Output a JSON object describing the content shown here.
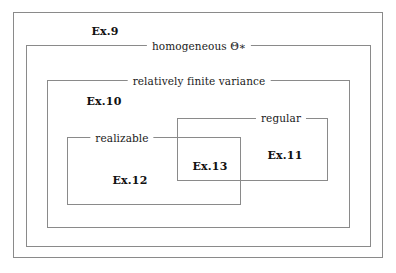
{
  "diagram": {
    "background_color": "#ffffff",
    "line_color": "#8a8a8a",
    "text_color": "#1a1a1a",
    "regions": [
      {
        "id": "outer",
        "edge_label": "",
        "example_label": "Ex.9",
        "x": 13,
        "y": 12,
        "width": 370,
        "height": 246
      },
      {
        "id": "homogeneous",
        "edge_label": "homogeneous Θ∗",
        "example_label": "",
        "x": 26,
        "y": 45,
        "width": 345,
        "height": 202
      },
      {
        "id": "relatively-finite-variance",
        "edge_label": "relatively finite variance",
        "example_label": "Ex.10",
        "x": 47,
        "y": 80,
        "width": 303,
        "height": 148
      },
      {
        "id": "regular",
        "edge_label": "regular",
        "example_label": "Ex.11",
        "x": 177,
        "y": 118,
        "width": 151,
        "height": 63
      },
      {
        "id": "realizable",
        "edge_label": "realizable",
        "example_label": "Ex.12",
        "x": 67,
        "y": 137,
        "width": 174,
        "height": 68
      }
    ],
    "intersection": {
      "id": "regular-realizable-intersection",
      "example_label": "Ex.13"
    },
    "edge_labels": {
      "homogeneous": "homogeneous Θ∗",
      "relatively_finite_variance": "relatively finite variance",
      "regular": "regular",
      "realizable": "realizable"
    },
    "example_labels": {
      "ex9": "Ex.9",
      "ex10": "Ex.10",
      "ex11": "Ex.11",
      "ex12": "Ex.12",
      "ex13": "Ex.13"
    }
  }
}
